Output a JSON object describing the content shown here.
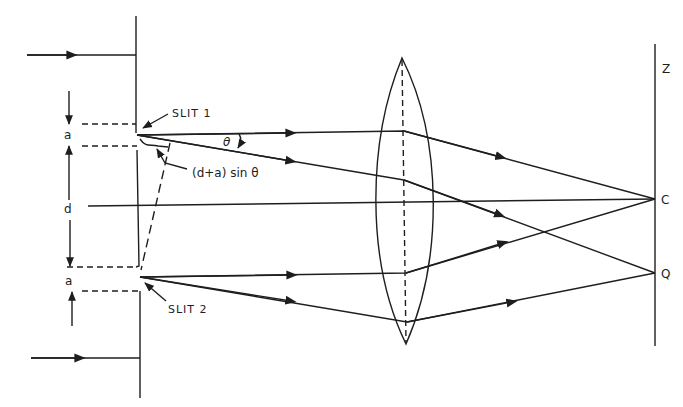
{
  "figure": {
    "labels": {
      "slit1": "SLIT 1",
      "slit2": "SLIT 2",
      "slit_width_top": "a",
      "slit_separation": "d",
      "slit_width_bottom": "a",
      "angle": "θ",
      "path_difference": "(d+a) sin θ",
      "screen_top": "Z",
      "screen_center": "C",
      "screen_point": "Q"
    },
    "colors": {
      "ink": "#1e1e1e",
      "background": "#ffffff"
    }
  }
}
